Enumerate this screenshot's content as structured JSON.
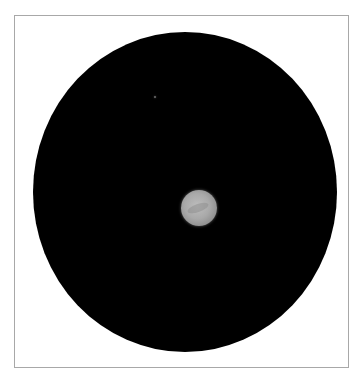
{
  "image": {
    "description": "Telescope image of a small gray planet at center of a dark circular vignette field, framed with a thin gray border",
    "frame_border_color": "#a8a8a8",
    "background_color": "#ffffff",
    "field_color": "#000000",
    "planet_color": "#a9a9a9"
  }
}
